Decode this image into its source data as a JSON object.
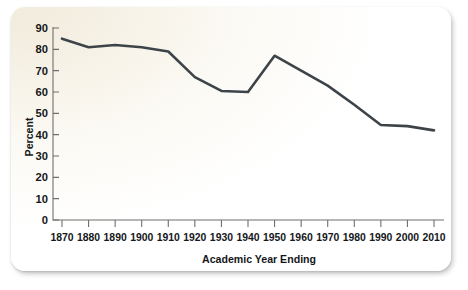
{
  "chart_data": {
    "type": "line",
    "title": "",
    "subtitle": "",
    "xlabel": "Academic Year Ending",
    "ylabel": "Percent",
    "x": [
      1870,
      1880,
      1890,
      1900,
      1910,
      1920,
      1930,
      1940,
      1950,
      1960,
      1970,
      1980,
      1990,
      2000,
      2010
    ],
    "values": [
      85,
      81,
      82,
      81,
      79,
      67,
      60.5,
      60,
      77,
      70,
      63,
      54,
      44.5,
      44,
      42
    ],
    "series": [
      {
        "name": "Percent",
        "values": [
          85,
          81,
          82,
          81,
          79,
          67,
          60.5,
          60,
          77,
          70,
          63,
          54,
          44.5,
          44,
          42
        ],
        "color": "#3d4449"
      }
    ],
    "x_tick_labels": [
      "1870",
      "1880",
      "1890",
      "1900",
      "1910",
      "1920",
      "1930",
      "1940",
      "1950",
      "1960",
      "1970",
      "1980",
      "1990",
      "2000",
      "2010"
    ],
    "y_tick_labels": [
      "0",
      "10",
      "20",
      "30",
      "40",
      "50",
      "60",
      "70",
      "80",
      "90"
    ],
    "y_ticks": [
      0,
      10,
      20,
      30,
      40,
      50,
      60,
      70,
      80,
      90
    ],
    "xlim": [
      1870,
      2010
    ],
    "ylim": [
      0,
      90
    ],
    "grid": false,
    "legend": false,
    "legend_position": "none",
    "line_color": "#3d4449",
    "axis_color": "#6e6f6d",
    "text_color": "#15171a",
    "background_color": "#f6f2e8",
    "annotations": []
  },
  "figure": {
    "card_name": "chart-card"
  }
}
